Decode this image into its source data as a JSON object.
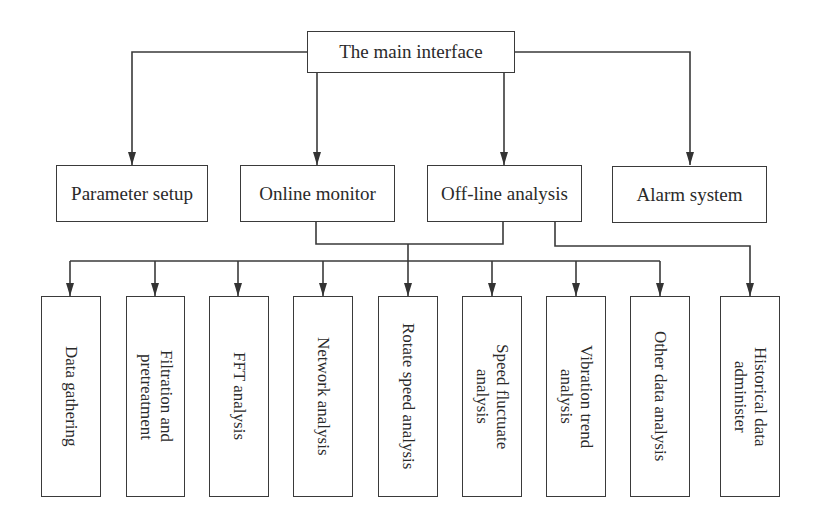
{
  "diagram": {
    "type": "hierarchy",
    "root": {
      "label": "The main interface"
    },
    "level2": [
      {
        "label": "Parameter setup"
      },
      {
        "label": "Online monitor"
      },
      {
        "label": "Off-line analysis"
      },
      {
        "label": "Alarm system"
      }
    ],
    "level3": [
      {
        "label": "Data gathering"
      },
      {
        "label": "Filtration and\npretreatment"
      },
      {
        "label": "FFT analysis"
      },
      {
        "label": "Network analysis"
      },
      {
        "label": "Rotate speed analysis"
      },
      {
        "label": "Speed fluctuate\nanalysis"
      },
      {
        "label": "Vibration trend\nanalysis"
      },
      {
        "label": "Other data analysis"
      },
      {
        "label": "Historical data\nadminister"
      }
    ],
    "edges": [
      [
        "The main interface",
        "Parameter setup"
      ],
      [
        "The main interface",
        "Online monitor"
      ],
      [
        "The main interface",
        "Off-line analysis"
      ],
      [
        "The main interface",
        "Alarm system"
      ],
      [
        "Online monitor + Off-line analysis",
        "Data gathering"
      ],
      [
        "Online monitor + Off-line analysis",
        "Filtration and pretreatment"
      ],
      [
        "Online monitor + Off-line analysis",
        "FFT analysis"
      ],
      [
        "Online monitor + Off-line analysis",
        "Network analysis"
      ],
      [
        "Online monitor + Off-line analysis",
        "Rotate speed analysis"
      ],
      [
        "Online monitor + Off-line analysis",
        "Speed fluctuate analysis"
      ],
      [
        "Online monitor + Off-line analysis",
        "Vibration trend analysis"
      ],
      [
        "Online monitor + Off-line analysis",
        "Other data analysis"
      ],
      [
        "Off-line analysis",
        "Historical data administer"
      ]
    ]
  },
  "colors": {
    "line": "#3a3a3a",
    "background": "#ffffff",
    "text": "#2a2a2a"
  }
}
